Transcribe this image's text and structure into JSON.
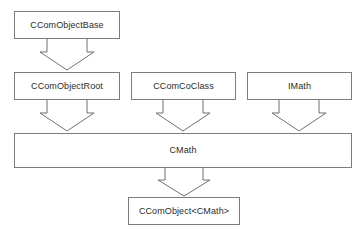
{
  "diagram": {
    "type": "uml-class-inheritance",
    "background_color": "#ffffff",
    "box_border_color": "#7a7d80",
    "box_fill_color": "#ffffff",
    "text_color": "#2b2b2b",
    "arrow_stroke_color": "#6e7174",
    "nodes": [
      {
        "id": "ccomobjectbase",
        "label": "CComObjectBase",
        "x": 14,
        "y": 11,
        "width": 106,
        "height": 28,
        "row": 0
      },
      {
        "id": "ccomobjectroot",
        "label": "CComObjectRoot",
        "x": 14,
        "y": 72,
        "width": 106,
        "height": 28,
        "row": 1
      },
      {
        "id": "ccomcoclass",
        "label": "CComCoClass",
        "x": 131,
        "y": 72,
        "width": 105,
        "height": 28,
        "row": 1
      },
      {
        "id": "imath",
        "label": "IMath",
        "x": 247,
        "y": 72,
        "width": 105,
        "height": 28,
        "row": 1
      },
      {
        "id": "cmath",
        "label": "CMath",
        "x": 14,
        "y": 133,
        "width": 338,
        "height": 35,
        "row": 2
      },
      {
        "id": "ccomobject_cmath",
        "label": "CComObject<CMath>",
        "x": 128,
        "y": 197,
        "width": 112,
        "height": 28,
        "row": 3
      }
    ],
    "connectors": [
      {
        "id": "arrow-base-to-root",
        "from": "ccomobjectbase",
        "to": "ccomobjectroot",
        "style": "block-arrow-down",
        "center_x": 67,
        "top_y": 39,
        "bottom_y": 71
      },
      {
        "id": "arrow-root-to-cmath",
        "from": "ccomobjectroot",
        "to": "cmath",
        "style": "block-arrow-down",
        "center_x": 67,
        "top_y": 100,
        "bottom_y": 132
      },
      {
        "id": "arrow-coclass-to-cmath",
        "from": "ccomcoclass",
        "to": "cmath",
        "style": "block-arrow-down",
        "center_x": 183,
        "top_y": 100,
        "bottom_y": 132
      },
      {
        "id": "arrow-imath-to-cmath",
        "from": "imath",
        "to": "cmath",
        "style": "block-arrow-down",
        "center_x": 299,
        "top_y": 100,
        "bottom_y": 132
      },
      {
        "id": "arrow-cmath-to-ccomobject",
        "from": "cmath",
        "to": "ccomobject_cmath",
        "style": "block-arrow-down",
        "center_x": 184,
        "top_y": 168,
        "bottom_y": 196
      }
    ],
    "caption": {
      "text": "",
      "visible": false
    }
  }
}
